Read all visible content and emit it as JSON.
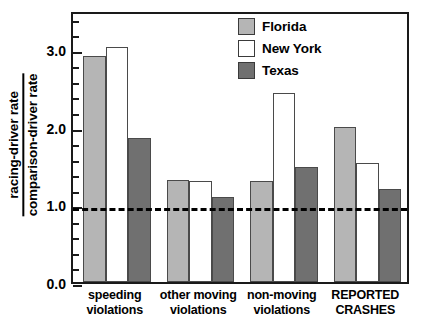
{
  "chart_data": {
    "type": "bar",
    "title": "",
    "xlabel": "",
    "ylabel": "racing-driver rate / comparison-driver rate",
    "ylabel_numerator": "racing-driver rate",
    "ylabel_denominator": "comparison-driver rate",
    "categories": [
      "speeding violations",
      "other moving violations",
      "non-moving violations",
      "REPORTED CRASHES"
    ],
    "category_lines": [
      [
        "speeding",
        "violations"
      ],
      [
        "other moving",
        "violations"
      ],
      [
        "non-moving",
        "violations"
      ],
      [
        "REPORTED",
        "CRASHES"
      ]
    ],
    "series": [
      {
        "name": "Florida",
        "color": "#b5b5b5",
        "values": [
          2.91,
          1.31,
          1.3,
          2.0
        ]
      },
      {
        "name": "New York",
        "color": "#ffffff",
        "values": [
          3.03,
          1.3,
          2.43,
          1.53
        ]
      },
      {
        "name": "Texas",
        "color": "#707070",
        "values": [
          1.85,
          1.09,
          1.48,
          1.2
        ]
      }
    ],
    "ylim": [
      0.0,
      3.5
    ],
    "ytick_values": [
      0.0,
      1.0,
      2.0,
      3.0
    ],
    "ytick_labels": [
      "0.0",
      "1.0",
      "2.0",
      "3.0"
    ],
    "yminor_step": 0.2,
    "grid": false,
    "reference_line": {
      "value": 1.0,
      "style": "dashed",
      "color": "#000000"
    },
    "legend": {
      "position": "top-right",
      "entries": [
        {
          "label": "Florida",
          "color": "#b5b5b5"
        },
        {
          "label": "New York",
          "color": "#ffffff"
        },
        {
          "label": "Texas",
          "color": "#707070"
        }
      ]
    }
  }
}
